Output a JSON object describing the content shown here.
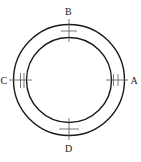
{
  "diagram": {
    "center": [
      69,
      80
    ],
    "outer_radius": 55,
    "inner_radius": 42.5,
    "stroke_color": "#1a1a1a",
    "tick_color": "#444444",
    "labels": {
      "A": "A",
      "B": "B",
      "C": "C",
      "D": "D"
    }
  }
}
